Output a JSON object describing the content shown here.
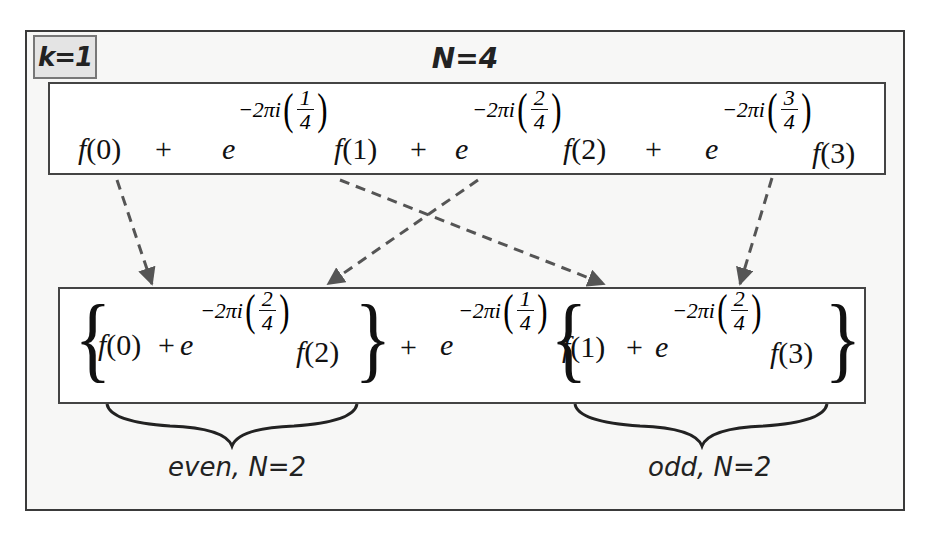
{
  "diagram": {
    "k_label": "k=1",
    "n_title": "N=4",
    "top_expression": {
      "terms": [
        {
          "text": "f(0)"
        },
        {
          "op": "+"
        },
        {
          "base": "e",
          "exponent": "-2πi",
          "fraction": {
            "num": "1",
            "den": "4"
          },
          "text": "f(1)"
        },
        {
          "op": "+"
        },
        {
          "base": "e",
          "exponent": "-2πi",
          "fraction": {
            "num": "2",
            "den": "4"
          },
          "text": "f(2)"
        },
        {
          "op": "+"
        },
        {
          "base": "e",
          "exponent": "-2πi",
          "fraction": {
            "num": "3",
            "den": "4"
          },
          "text": "f(3)"
        }
      ],
      "plus": "+",
      "e": "e",
      "exp": "−2πi",
      "f0": "f(0)",
      "f1": "f(1)",
      "f2": "f(2)",
      "f3": "f(3)",
      "frac1": {
        "num": "1",
        "den": "4"
      },
      "frac2": {
        "num": "2",
        "den": "4"
      },
      "frac3": {
        "num": "3",
        "den": "4"
      }
    },
    "bottom_expression": {
      "even_group": {
        "f0": "f(0)",
        "plus": "+",
        "e": "e",
        "exp": "−2πi",
        "frac": {
          "num": "2",
          "den": "4"
        },
        "f2": "f(2)"
      },
      "middle": {
        "plus": "+",
        "e": "e",
        "exp": "−2πi",
        "frac": {
          "num": "1",
          "den": "4"
        }
      },
      "odd_group": {
        "f1": "f(1)",
        "plus": "+",
        "e": "e",
        "exp": "−2πi",
        "frac": {
          "num": "2",
          "den": "4"
        },
        "f3": "f(3)"
      },
      "open_brace": "{",
      "close_brace": "}"
    },
    "group_labels": {
      "even": "even, N=2",
      "odd": "odd, N=2"
    },
    "arrows": [
      {
        "from": "f(0)",
        "to": "even group start"
      },
      {
        "from": "f(1)",
        "to": "odd group start"
      },
      {
        "from": "f(2)",
        "to": "even group f(2)"
      },
      {
        "from": "f(3)",
        "to": "odd group f(3)"
      }
    ],
    "colors": {
      "frame_border": "#3a3a3a",
      "frame_fill": "#f7f7f6",
      "box_fill": "#ffffff",
      "k_label_fill": "#e4e4e4",
      "arrow": "#555555",
      "text": "#111111"
    }
  }
}
